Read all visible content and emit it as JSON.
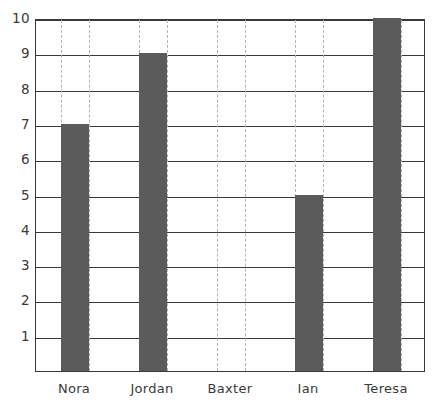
{
  "chart_data": {
    "type": "bar",
    "title": "",
    "xlabel": "",
    "ylabel": "",
    "categories": [
      "Nora",
      "Jordan",
      "Baxter",
      "Ian",
      "Teresa"
    ],
    "values": [
      7,
      9,
      0,
      5,
      10
    ],
    "ylim": [
      0,
      10
    ],
    "yticks": [
      1,
      2,
      3,
      4,
      5,
      6,
      7,
      8,
      9,
      10
    ],
    "ytick_labels": [
      "1",
      "2",
      "3",
      "4",
      "5",
      "6",
      "7",
      "8",
      "9",
      "10"
    ],
    "grid": {
      "horizontal": "solid",
      "vertical": "dashed",
      "vertical_at_bar_edges": true
    },
    "legend": null,
    "bar_color": "#5b5b5b",
    "grid_color": "#3a3a3a",
    "dash_color": "#b3b3b3",
    "axis_color": "#3a3a3a",
    "background": "#ffffff",
    "bar_width_px": 28,
    "series": [
      {
        "name": "values",
        "values": [
          7,
          9,
          0,
          5,
          10
        ]
      }
    ],
    "points": [
      {
        "category": "Nora",
        "value": 7
      },
      {
        "category": "Jordan",
        "value": 9
      },
      {
        "category": "Baxter",
        "value": 0
      },
      {
        "category": "Ian",
        "value": 5
      },
      {
        "category": "Teresa",
        "value": 10
      }
    ]
  }
}
